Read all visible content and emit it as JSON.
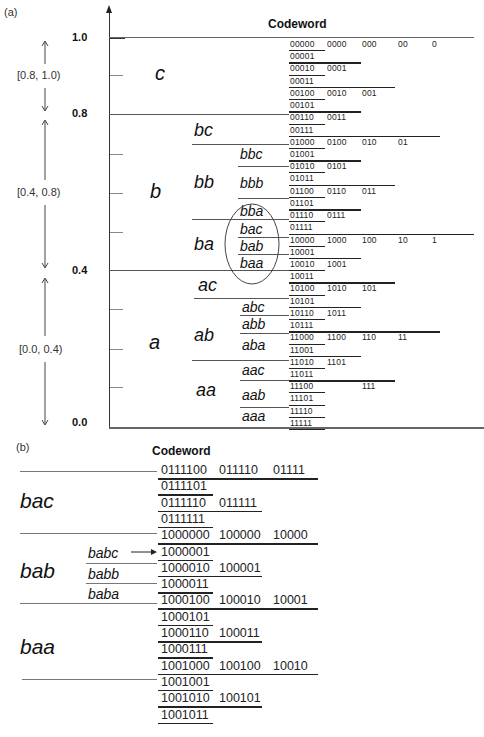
{
  "panel_a": {
    "label": "(a)",
    "header": "Codeword",
    "axis_ticks": [
      {
        "label": "1.0",
        "y": 37
      },
      {
        "label": "0.8",
        "y": 114
      },
      {
        "label": "0.4",
        "y": 270
      },
      {
        "label": "0.0",
        "y": 422
      }
    ],
    "ranges": [
      {
        "label": "[0.8, 1.0)",
        "y": 75
      },
      {
        "label": "[0.4, 0.8)",
        "y": 192
      },
      {
        "label": "[0.0, 0.4)",
        "y": 349
      }
    ],
    "level1": [
      {
        "label": "c",
        "x": 155,
        "y": 63
      },
      {
        "label": "b",
        "x": 150,
        "y": 180
      },
      {
        "label": "a",
        "x": 149,
        "y": 331
      }
    ],
    "level2": [
      {
        "label": "bc",
        "x": 194,
        "y": 120
      },
      {
        "label": "bb",
        "x": 194,
        "y": 172
      },
      {
        "label": "ba",
        "x": 194,
        "y": 235
      },
      {
        "label": "ac",
        "x": 198,
        "y": 275
      },
      {
        "label": "ab",
        "x": 194,
        "y": 325
      },
      {
        "label": "aa",
        "x": 196,
        "y": 380
      }
    ],
    "level3": [
      {
        "label": "bbc",
        "x": 240,
        "y": 146
      },
      {
        "label": "bbb",
        "x": 240,
        "y": 175
      },
      {
        "label": "bba",
        "x": 240,
        "y": 203
      },
      {
        "label": "bac",
        "x": 240,
        "y": 221
      },
      {
        "label": "bab",
        "x": 240,
        "y": 238
      },
      {
        "label": "baa",
        "x": 240,
        "y": 255
      },
      {
        "label": "abc",
        "x": 242,
        "y": 299
      },
      {
        "label": "abb",
        "x": 242,
        "y": 316
      },
      {
        "label": "aba",
        "x": 242,
        "y": 335
      },
      {
        "label": "aac",
        "x": 242,
        "y": 360
      },
      {
        "label": "aab",
        "x": 242,
        "y": 385
      },
      {
        "label": "aaa",
        "x": 242,
        "y": 405
      }
    ],
    "codewords": [
      [
        "00000",
        "0000",
        "000",
        "00",
        "0"
      ],
      [
        "00001"
      ],
      [
        "00010",
        "0001"
      ],
      [
        "00011"
      ],
      [
        "00100",
        "0010",
        "001"
      ],
      [
        "00101"
      ],
      [
        "00110",
        "0011"
      ],
      [
        "00111"
      ],
      [
        "01000",
        "0100",
        "010",
        "01"
      ],
      [
        "01001"
      ],
      [
        "01010",
        "0101"
      ],
      [
        "01011"
      ],
      [
        "01100",
        "0110",
        "011"
      ],
      [
        "01101"
      ],
      [
        "01110",
        "0111"
      ],
      [
        "01111"
      ],
      [
        "10000",
        "1000",
        "100",
        "10",
        "1"
      ],
      [
        "10001"
      ],
      [
        "10010",
        "1001"
      ],
      [
        "10011"
      ],
      [
        "10100",
        "1010",
        "101"
      ],
      [
        "10101"
      ],
      [
        "10110",
        "1011"
      ],
      [
        "10111"
      ],
      [
        "11000",
        "1100",
        "110",
        "11"
      ],
      [
        "11001"
      ],
      [
        "11010",
        "1101"
      ],
      [
        "11011"
      ],
      [
        "11100",
        "",
        "111"
      ],
      [
        "11101"
      ],
      [
        "11110"
      ],
      [
        "11111"
      ]
    ]
  },
  "panel_b": {
    "label": "(b)",
    "header": "Codeword",
    "level1": [
      {
        "label": "bac",
        "y": 490
      },
      {
        "label": "bab",
        "y": 556
      },
      {
        "label": "baa",
        "y": 636
      }
    ],
    "level2": [
      {
        "label": "babc",
        "y": 545
      },
      {
        "label": "babb",
        "y": 569
      },
      {
        "label": "baba",
        "y": 588
      }
    ],
    "codewords": [
      [
        "0111100",
        "011110",
        "01111"
      ],
      [
        "0111101"
      ],
      [
        "0111110",
        "011111"
      ],
      [
        "0111111"
      ],
      [
        "1000000",
        "100000",
        "10000"
      ],
      [
        "1000001"
      ],
      [
        "1000010",
        "100001"
      ],
      [
        "1000011"
      ],
      [
        "1000100",
        "100010",
        "10001"
      ],
      [
        "1000101"
      ],
      [
        "1000110",
        "100011"
      ],
      [
        "1000111"
      ],
      [
        "1001000",
        "100100",
        "10010"
      ],
      [
        "1001001"
      ],
      [
        "1001010",
        "100101"
      ],
      [
        "1001011"
      ]
    ]
  }
}
